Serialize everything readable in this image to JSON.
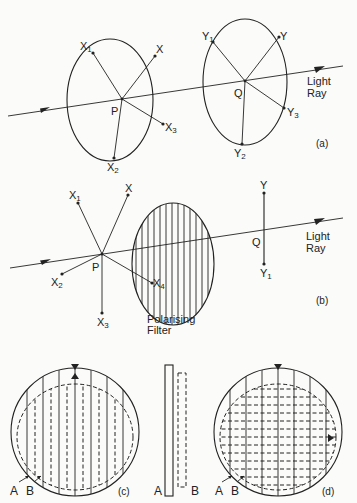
{
  "figure": {
    "panel_a": {
      "label": "(a)",
      "point_p": "P",
      "point_q": "Q",
      "x_points": [
        {
          "base": "X",
          "sub": ""
        },
        {
          "base": "X",
          "sub": "1"
        },
        {
          "base": "X",
          "sub": "2"
        },
        {
          "base": "X",
          "sub": "3"
        }
      ],
      "y_points": [
        {
          "base": "Y",
          "sub": ""
        },
        {
          "base": "Y",
          "sub": "1"
        },
        {
          "base": "Y",
          "sub": "2"
        },
        {
          "base": "Y",
          "sub": "3"
        }
      ],
      "ray_label_line1": "Light",
      "ray_label_line2": "Ray"
    },
    "panel_b": {
      "label": "(b)",
      "point_p": "P",
      "point_q": "Q",
      "x_points": [
        {
          "base": "X",
          "sub": ""
        },
        {
          "base": "X",
          "sub": "1"
        },
        {
          "base": "X",
          "sub": "2"
        },
        {
          "base": "X",
          "sub": "3"
        },
        {
          "base": "X",
          "sub": "4"
        }
      ],
      "y_points": [
        {
          "base": "Y",
          "sub": ""
        },
        {
          "base": "Y",
          "sub": "1"
        }
      ],
      "filter_label_line1": "Polarising",
      "filter_label_line2": "Filter",
      "ray_label_line1": "Light",
      "ray_label_line2": "Ray"
    },
    "panel_c": {
      "label": "(c)",
      "marker_a": "A",
      "marker_b": "B"
    },
    "panel_side": {
      "marker_a": "A",
      "marker_b": "B"
    },
    "panel_d": {
      "label": "(d)",
      "marker_a": "A",
      "marker_b": "B"
    }
  }
}
